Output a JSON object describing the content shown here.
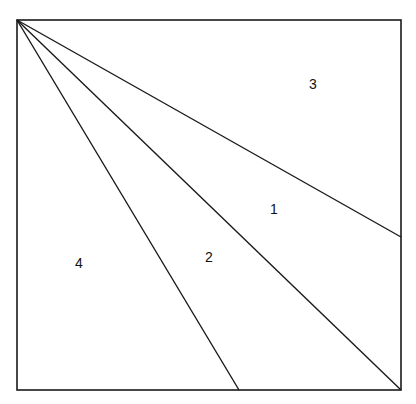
{
  "diagram": {
    "type": "square divided into regions by lines from top-left corner",
    "stroke_color": "#1a1a1a",
    "background": "#ffffff",
    "square": {
      "x1": 17,
      "y1": 20,
      "x2": 401,
      "y2": 390
    },
    "apex": {
      "x": 17,
      "y": 20
    },
    "lines": [
      {
        "id": "line-to-right-side",
        "x2": 401,
        "y2": 237
      },
      {
        "id": "line-to-bottom-right",
        "x2": 401,
        "y2": 390
      },
      {
        "id": "line-to-bottom",
        "x2": 239,
        "y2": 390
      }
    ],
    "regions": [
      {
        "label": "1",
        "x": 274,
        "y": 214
      },
      {
        "label": "2",
        "x": 209,
        "y": 262
      },
      {
        "label": "3",
        "x": 313,
        "y": 89
      },
      {
        "label": "4",
        "x": 79,
        "y": 268
      }
    ]
  }
}
